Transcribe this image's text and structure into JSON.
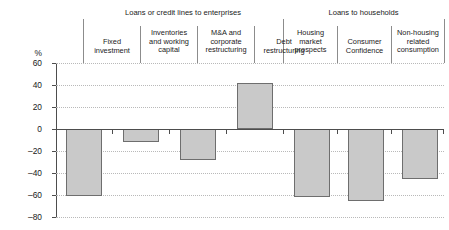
{
  "chart_data": {
    "type": "bar",
    "title": "",
    "subtitle": "",
    "xlabel": "",
    "ylabel": "%",
    "ylim": [
      -80,
      60
    ],
    "yticks": [
      60,
      40,
      20,
      0,
      -20,
      -40,
      -60,
      -80
    ],
    "ytick_labels": [
      "60",
      "40",
      "20",
      "0",
      "–20",
      "–40",
      "–60",
      "–80"
    ],
    "grid": true,
    "legend": "none",
    "zero_line": true,
    "categories": [
      "Fixed investment",
      "Inventories and working capital",
      "M&A and corporate restructuring",
      "Debt restructuring",
      "Housing market prospects",
      "Consumer Confidence",
      "Non-housing related consumption"
    ],
    "values": [
      -61,
      -12,
      -28,
      42,
      -62,
      -65,
      -45
    ],
    "bar_color": "#c9c9c9",
    "bar_edge_color": "#6e6e6e",
    "groups": [
      {
        "label": "Loans or credit lines to enterprises",
        "categories": [
          "Fixed investment",
          "Inventories and working capital",
          "M&A and corporate restructuring",
          "Debt restructuring"
        ]
      },
      {
        "label": "Loans to households",
        "categories": [
          "Housing market prospects",
          "Consumer Confidence",
          "Non-housing related consumption"
        ]
      }
    ]
  },
  "columns": [
    {
      "line1": "Fixed",
      "line2": "investment",
      "line3": ""
    },
    {
      "line1": "Inventories",
      "line2": "and working",
      "line3": "capital"
    },
    {
      "line1": "M&A and",
      "line2": "corporate",
      "line3": "restructuring"
    },
    {
      "line1": "Debt",
      "line2": "restructuring",
      "line3": ""
    },
    {
      "line1": "Housing",
      "line2": "market",
      "line3": "prospects"
    },
    {
      "line1": "Consumer",
      "line2": "Confidence",
      "line3": ""
    },
    {
      "line1": "Non-housing",
      "line2": "related",
      "line3": "consumption"
    }
  ],
  "groups": {
    "enterprises": "Loans or credit lines to enterprises",
    "households": "Loans to households"
  },
  "axis": {
    "unit": "%",
    "t60": "60",
    "t40": "40",
    "t20": "20",
    "t0": "0",
    "tm20": "–20",
    "tm40": "–40",
    "tm60": "–60",
    "tm80": "–80"
  }
}
